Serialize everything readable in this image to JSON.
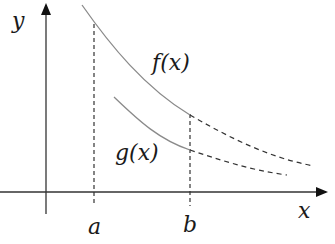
{
  "diagram": {
    "title": "",
    "axes": {
      "x_label": "x",
      "y_label": "y"
    },
    "curves": [
      {
        "id": "f",
        "label": "f(x)",
        "style": "solid within [a,b], dashed beyond b"
      },
      {
        "id": "g",
        "label": "g(x)",
        "style": "solid up to b, dashed beyond b"
      }
    ],
    "markers": [
      {
        "id": "a",
        "label": "a"
      },
      {
        "id": "b",
        "label": "b"
      }
    ],
    "colors": {
      "axis": "#222222",
      "curve": "#8a8a8a",
      "dashed": "#333333",
      "text": "#1a1a1a"
    }
  }
}
